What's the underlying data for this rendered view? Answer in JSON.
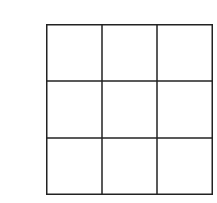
{
  "grid": {
    "rows": 3,
    "cols": 3,
    "line_color": "#222222",
    "background": "#ffffff",
    "cells": [
      [
        "",
        "",
        ""
      ],
      [
        "",
        "",
        ""
      ],
      [
        "",
        "",
        ""
      ]
    ]
  }
}
